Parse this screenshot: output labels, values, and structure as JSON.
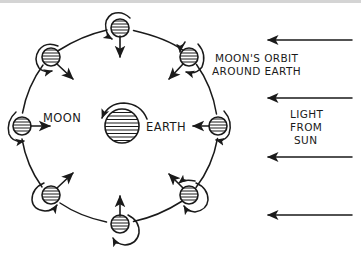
{
  "diagram": {
    "background_color": "#ffffff",
    "ink_color": "#1a1a1a",
    "top_strip_color": "#d4d4d4",
    "width": 361,
    "height": 253
  },
  "labels": {
    "earth": "EARTH",
    "moon": "MOON",
    "orbit_line1": "MOON'S ORBIT",
    "orbit_line2": "AROUND EARTH",
    "light_line1": "LIGHT",
    "light_line2": "FROM",
    "light_line3": "SUN"
  },
  "earth": {
    "name": "earth-body",
    "cx": 122,
    "cy": 126,
    "r": 17,
    "hatch_lines": 9,
    "rotation": "counterclockwise",
    "rotation_arc_name": "earth-rotation-arrow"
  },
  "orbit": {
    "name": "moon-orbit-path",
    "cx": 120,
    "cy": 126,
    "r": 98,
    "style": "dashed-segments-hand-drawn",
    "direction": "counterclockwise",
    "moon_count": 8
  },
  "moons": [
    {
      "name": "moon-position-right",
      "angle_deg": 0,
      "cx": 218,
      "cy": 126,
      "r": 9,
      "face_arrow": "points-left-toward-earth",
      "rotation": "counterclockwise"
    },
    {
      "name": "moon-position-upper-right",
      "angle_deg": 45,
      "cx": 189,
      "cy": 57,
      "r": 9,
      "face_arrow": "points-lower-left-toward-earth",
      "rotation": "counterclockwise"
    },
    {
      "name": "moon-position-top",
      "angle_deg": 90,
      "cx": 120,
      "cy": 28,
      "r": 9,
      "face_arrow": "points-down-toward-earth",
      "rotation": "counterclockwise"
    },
    {
      "name": "moon-position-upper-left",
      "angle_deg": 135,
      "cx": 51,
      "cy": 57,
      "r": 9,
      "face_arrow": "points-lower-right-toward-earth",
      "rotation": "counterclockwise"
    },
    {
      "name": "moon-position-left",
      "angle_deg": 180,
      "cx": 22,
      "cy": 126,
      "r": 9,
      "face_arrow": "points-right-toward-earth",
      "rotation": "counterclockwise"
    },
    {
      "name": "moon-position-lower-left",
      "angle_deg": 225,
      "cx": 51,
      "cy": 195,
      "r": 9,
      "face_arrow": "points-upper-right-toward-earth",
      "rotation": "counterclockwise"
    },
    {
      "name": "moon-position-bottom",
      "angle_deg": 270,
      "cx": 120,
      "cy": 224,
      "r": 9,
      "face_arrow": "points-up-toward-earth",
      "rotation": "counterclockwise"
    },
    {
      "name": "moon-position-lower-right",
      "angle_deg": 315,
      "cx": 189,
      "cy": 195,
      "r": 9,
      "face_arrow": "points-upper-left-toward-earth",
      "rotation": "counterclockwise"
    }
  ],
  "sunlight_arrows": {
    "name": "sunlight-rays",
    "direction": "right-to-left",
    "count": 4,
    "x_start": 352,
    "x_end": 267,
    "y_positions": [
      40,
      98,
      157,
      215
    ]
  }
}
